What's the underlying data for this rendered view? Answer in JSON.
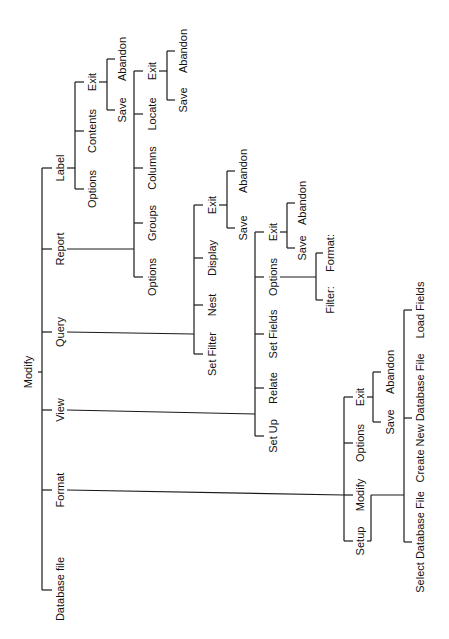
{
  "diagram": {
    "orientation": "rotated -90deg (text reads bottom-to-top)",
    "root": {
      "id": "root",
      "label": "Modify",
      "x": 28,
      "y": 372
    },
    "nodes": [
      {
        "id": "label",
        "label": "Label",
        "x": 60,
        "y": 168
      },
      {
        "id": "report",
        "label": "Report",
        "x": 60,
        "y": 249
      },
      {
        "id": "query",
        "label": "Query",
        "x": 60,
        "y": 332
      },
      {
        "id": "view",
        "label": "View",
        "x": 60,
        "y": 410
      },
      {
        "id": "format",
        "label": "Format",
        "x": 60,
        "y": 490
      },
      {
        "id": "dbfile",
        "label": "Database file",
        "x": 60,
        "y": 589
      },
      {
        "id": "label-options",
        "label": "Options",
        "x": 92,
        "y": 189
      },
      {
        "id": "label-contents",
        "label": "Contents",
        "x": 92,
        "y": 131
      },
      {
        "id": "label-exit",
        "label": "Exit",
        "x": 92,
        "y": 82
      },
      {
        "id": "label-exit-save",
        "label": "Save",
        "x": 122,
        "y": 110
      },
      {
        "id": "label-exit-abandon",
        "label": "Abandon",
        "x": 122,
        "y": 59
      },
      {
        "id": "report-options",
        "label": "Options",
        "x": 152,
        "y": 277
      },
      {
        "id": "report-groups",
        "label": "Groups",
        "x": 152,
        "y": 223
      },
      {
        "id": "report-columns",
        "label": "Columns",
        "x": 152,
        "y": 168
      },
      {
        "id": "report-locate",
        "label": "Locate",
        "x": 152,
        "y": 114
      },
      {
        "id": "report-exit",
        "label": "Exit",
        "x": 152,
        "y": 71
      },
      {
        "id": "report-exit-save",
        "label": "Save",
        "x": 183,
        "y": 100
      },
      {
        "id": "report-exit-abandon",
        "label": "Abandon",
        "x": 183,
        "y": 51
      },
      {
        "id": "query-setfilter",
        "label": "Set Filter",
        "x": 212,
        "y": 354
      },
      {
        "id": "query-nest",
        "label": "Nest",
        "x": 212,
        "y": 305
      },
      {
        "id": "query-display",
        "label": "Display",
        "x": 212,
        "y": 258
      },
      {
        "id": "query-exit",
        "label": "Exit",
        "x": 212,
        "y": 205
      },
      {
        "id": "query-exit-save",
        "label": "Save",
        "x": 243,
        "y": 228
      },
      {
        "id": "query-exit-abandon",
        "label": "Abandon",
        "x": 243,
        "y": 171
      },
      {
        "id": "view-setup",
        "label": "Set Up",
        "x": 273,
        "y": 436
      },
      {
        "id": "view-relate",
        "label": "Relate",
        "x": 273,
        "y": 388
      },
      {
        "id": "view-setfields",
        "label": "Set Fields",
        "x": 273,
        "y": 334
      },
      {
        "id": "view-options",
        "label": "Options",
        "x": 273,
        "y": 277
      },
      {
        "id": "view-exit",
        "label": "Exit",
        "x": 273,
        "y": 232
      },
      {
        "id": "view-exit-save",
        "label": "Save",
        "x": 302,
        "y": 248
      },
      {
        "id": "view-exit-abandon",
        "label": "Abandon",
        "x": 302,
        "y": 203
      },
      {
        "id": "view-options-format",
        "label": "Format:",
        "x": 330,
        "y": 253
      },
      {
        "id": "view-options-filter",
        "label": "Filter:",
        "x": 330,
        "y": 300
      },
      {
        "id": "format-setup",
        "label": "Setup",
        "x": 360,
        "y": 541
      },
      {
        "id": "format-modify",
        "label": "Modify",
        "x": 360,
        "y": 495
      },
      {
        "id": "format-options",
        "label": "Options",
        "x": 360,
        "y": 443
      },
      {
        "id": "format-exit",
        "label": "Exit",
        "x": 360,
        "y": 397
      },
      {
        "id": "format-exit-save",
        "label": "Save",
        "x": 390,
        "y": 422
      },
      {
        "id": "format-exit-abandon",
        "label": "Abandon",
        "x": 390,
        "y": 372
      },
      {
        "id": "format-modify-select",
        "label": "Select Database File",
        "x": 420,
        "y": 542
      },
      {
        "id": "format-modify-create",
        "label": "Create New Database File",
        "x": 420,
        "y": 418
      },
      {
        "id": "format-modify-load",
        "label": "Load Fields",
        "x": 420,
        "y": 310
      }
    ],
    "lines": [
      [
        38,
        372,
        42,
        372
      ],
      [
        42,
        168,
        42,
        590
      ],
      [
        42,
        168,
        52,
        168
      ],
      [
        42,
        249,
        52,
        249
      ],
      [
        42,
        332,
        52,
        332
      ],
      [
        42,
        410,
        52,
        410
      ],
      [
        42,
        490,
        52,
        490
      ],
      [
        42,
        590,
        52,
        590
      ],
      [
        67,
        168,
        75,
        168
      ],
      [
        75,
        82,
        75,
        189
      ],
      [
        75,
        189,
        84,
        189
      ],
      [
        75,
        131,
        84,
        131
      ],
      [
        75,
        82,
        84,
        82
      ],
      [
        99,
        82,
        107,
        82
      ],
      [
        107,
        59,
        107,
        110
      ],
      [
        107,
        110,
        115,
        110
      ],
      [
        107,
        59,
        115,
        59
      ],
      [
        67,
        249,
        134,
        249
      ],
      [
        134,
        71,
        134,
        277
      ],
      [
        134,
        277,
        143,
        277
      ],
      [
        134,
        223,
        143,
        223
      ],
      [
        134,
        168,
        143,
        168
      ],
      [
        134,
        114,
        143,
        114
      ],
      [
        134,
        71,
        143,
        71
      ],
      [
        159,
        71,
        167,
        71
      ],
      [
        167,
        51,
        167,
        100
      ],
      [
        167,
        100,
        175,
        100
      ],
      [
        167,
        51,
        175,
        51
      ],
      [
        67,
        332,
        194,
        334
      ],
      [
        194,
        205,
        194,
        354
      ],
      [
        194,
        354,
        203,
        354
      ],
      [
        194,
        305,
        203,
        305
      ],
      [
        194,
        258,
        203,
        258
      ],
      [
        194,
        205,
        203,
        205
      ],
      [
        219,
        205,
        227,
        205
      ],
      [
        227,
        171,
        227,
        228
      ],
      [
        227,
        228,
        235,
        228
      ],
      [
        227,
        171,
        235,
        171
      ],
      [
        67,
        410,
        255,
        414
      ],
      [
        255,
        232,
        255,
        436
      ],
      [
        255,
        436,
        264,
        436
      ],
      [
        255,
        388,
        264,
        388
      ],
      [
        255,
        334,
        264,
        334
      ],
      [
        255,
        277,
        264,
        277
      ],
      [
        255,
        232,
        264,
        232
      ],
      [
        280,
        232,
        287,
        232
      ],
      [
        287,
        203,
        287,
        248
      ],
      [
        287,
        248,
        295,
        248
      ],
      [
        287,
        203,
        295,
        203
      ],
      [
        280,
        277,
        316,
        277
      ],
      [
        316,
        253,
        316,
        300
      ],
      [
        316,
        253,
        323,
        253
      ],
      [
        316,
        300,
        323,
        300
      ],
      [
        67,
        490,
        344,
        495
      ],
      [
        344,
        397,
        344,
        541
      ],
      [
        344,
        541,
        353,
        541
      ],
      [
        344,
        443,
        353,
        443
      ],
      [
        344,
        397,
        353,
        397
      ],
      [
        344,
        495,
        353,
        495
      ],
      [
        367,
        397,
        373,
        397
      ],
      [
        373,
        372,
        373,
        422
      ],
      [
        373,
        422,
        381,
        422
      ],
      [
        373,
        372,
        381,
        372
      ],
      [
        367,
        541,
        371,
        541
      ],
      [
        371,
        495,
        371,
        541
      ],
      [
        371,
        495,
        404,
        495
      ],
      [
        404,
        310,
        404,
        542
      ],
      [
        404,
        542,
        412,
        542
      ],
      [
        404,
        418,
        412,
        418
      ],
      [
        404,
        310,
        412,
        310
      ]
    ]
  }
}
